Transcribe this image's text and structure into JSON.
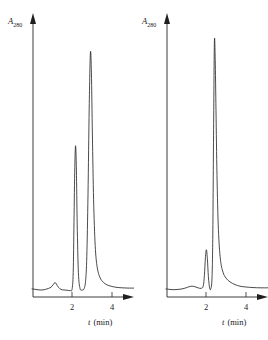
{
  "figure": {
    "background_color": "#ffffff",
    "line_color": "#2b2b2b",
    "panel_count": 2
  },
  "chart_data": [
    {
      "type": "line",
      "title": "",
      "panel_label": "left",
      "xlabel": "t (min)",
      "ylabel": "A",
      "ylabel_subscript": "280",
      "xlabel_variable": "t",
      "xlabel_unit": "(min)",
      "xlim": [
        0,
        5.2
      ],
      "ylim": [
        0,
        1.0
      ],
      "xticks": [
        2,
        4
      ],
      "xtick_labels": [
        "2",
        "4"
      ],
      "yticks": [],
      "ytick_labels": [],
      "grid": false,
      "legend": "none",
      "axis_style": "arrow-terminated L-axes",
      "annotations": [],
      "peaks": [
        {
          "name": "baseline-ripple",
          "center": 1.15,
          "height": 0.035,
          "width": 0.3,
          "shape": "broad-bump"
        },
        {
          "name": "peak-1",
          "center": 2.18,
          "height": 0.56,
          "width": 0.055,
          "shape": "sharp-gaussian"
        },
        {
          "name": "peak-2",
          "center": 2.92,
          "height": 0.905,
          "width": 0.07,
          "shape": "sharp-gaussian-tailing"
        }
      ],
      "baseline": 0.022,
      "x": [
        0.0,
        0.2,
        0.4,
        0.6,
        0.75,
        0.9,
        1.0,
        1.1,
        1.15,
        1.22,
        1.32,
        1.45,
        1.6,
        1.75,
        1.9,
        2.0,
        2.06,
        2.1,
        2.14,
        2.18,
        2.22,
        2.26,
        2.32,
        2.4,
        2.5,
        2.6,
        2.68,
        2.74,
        2.8,
        2.86,
        2.92,
        2.97,
        3.02,
        3.08,
        3.16,
        3.26,
        3.4,
        3.56,
        3.75,
        3.95,
        4.2,
        4.5,
        4.8,
        5.1
      ],
      "y": [
        0.03,
        0.028,
        0.026,
        0.027,
        0.03,
        0.034,
        0.04,
        0.05,
        0.054,
        0.048,
        0.036,
        0.028,
        0.026,
        0.025,
        0.024,
        0.028,
        0.09,
        0.28,
        0.48,
        0.56,
        0.47,
        0.27,
        0.09,
        0.032,
        0.026,
        0.03,
        0.06,
        0.15,
        0.38,
        0.7,
        0.905,
        0.83,
        0.6,
        0.36,
        0.19,
        0.11,
        0.072,
        0.055,
        0.045,
        0.04,
        0.036,
        0.034,
        0.033,
        0.033
      ]
    },
    {
      "type": "line",
      "title": "",
      "panel_label": "right",
      "xlabel": "t (min)",
      "ylabel": "A",
      "ylabel_subscript": "280",
      "xlabel_variable": "t",
      "xlabel_unit": "(min)",
      "xlim": [
        0,
        5.2
      ],
      "ylim": [
        0,
        1.0
      ],
      "xticks": [
        2,
        4
      ],
      "xtick_labels": [
        "2",
        "4"
      ],
      "yticks": [],
      "ytick_labels": [],
      "grid": false,
      "legend": "none",
      "axis_style": "arrow-terminated L-axes",
      "annotations": [],
      "peaks": [
        {
          "name": "baseline-ripple",
          "center": 1.3,
          "height": 0.025,
          "width": 0.4,
          "shape": "broad-bump"
        },
        {
          "name": "peak-1",
          "center": 2.02,
          "height": 0.175,
          "width": 0.05,
          "shape": "sharp-gaussian"
        },
        {
          "name": "peak-2",
          "center": 2.42,
          "height": 0.945,
          "width": 0.06,
          "shape": "sharp-gaussian-tailing"
        }
      ],
      "baseline": 0.022,
      "x": [
        0.0,
        0.2,
        0.4,
        0.6,
        0.8,
        1.0,
        1.15,
        1.3,
        1.45,
        1.6,
        1.75,
        1.86,
        1.92,
        1.97,
        2.02,
        2.07,
        2.12,
        2.18,
        2.24,
        2.3,
        2.34,
        2.38,
        2.42,
        2.46,
        2.5,
        2.55,
        2.62,
        2.72,
        2.85,
        3.0,
        3.2,
        3.45,
        3.7,
        4.0,
        4.35,
        4.7,
        5.1
      ],
      "y": [
        0.03,
        0.028,
        0.027,
        0.028,
        0.03,
        0.034,
        0.038,
        0.04,
        0.038,
        0.034,
        0.032,
        0.04,
        0.08,
        0.145,
        0.175,
        0.14,
        0.075,
        0.034,
        0.03,
        0.07,
        0.23,
        0.62,
        0.945,
        0.88,
        0.69,
        0.45,
        0.25,
        0.14,
        0.092,
        0.07,
        0.056,
        0.046,
        0.04,
        0.037,
        0.035,
        0.034,
        0.034
      ]
    }
  ]
}
